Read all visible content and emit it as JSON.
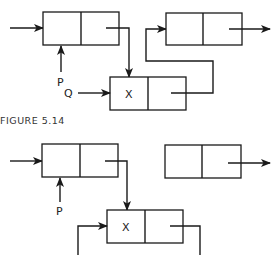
{
  "figure_top": {
    "caption": "FIGURE 5.14",
    "pointer_p_label": "P",
    "pointer_q_label": "Q",
    "new_node_value": "X",
    "nodes": [
      {
        "id": "node-a",
        "value": ""
      },
      {
        "id": "node-x",
        "value": "X"
      },
      {
        "id": "node-b",
        "value": ""
      }
    ]
  },
  "figure_bottom": {
    "pointer_p_label": "P",
    "new_node_value": "X",
    "nodes": [
      {
        "id": "node-a",
        "value": ""
      },
      {
        "id": "node-x",
        "value": "X"
      },
      {
        "id": "node-b",
        "value": ""
      }
    ]
  },
  "colors": {
    "line": "#1a1a1a",
    "background": "#ffffff"
  }
}
